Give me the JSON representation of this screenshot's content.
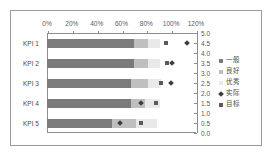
{
  "chart_data": {
    "type": "bar",
    "title": "",
    "xlabel": "",
    "ylabel": "",
    "categories": [
      "KPI 1",
      "KPI 2",
      "KPI 3",
      "KPI 4",
      "KPI 5"
    ],
    "x_tick_labels": [
      "0%",
      "20%",
      "40%",
      "60%",
      "80%",
      "100%",
      "120%"
    ],
    "x_tick_values": [
      0,
      20,
      40,
      60,
      80,
      100,
      120
    ],
    "xlim": [
      0,
      120
    ],
    "y2_tick_labels": [
      "0.0",
      "0.5",
      "1.0",
      "1.5",
      "2.0",
      "2.5",
      "3.0",
      "3.5",
      "4.0",
      "4.5",
      "5.0"
    ],
    "y2_tick_values": [
      0.0,
      0.5,
      1.0,
      1.5,
      2.0,
      2.5,
      3.0,
      3.5,
      4.0,
      4.5,
      5.0
    ],
    "y2lim": [
      0,
      5
    ],
    "grid": false,
    "legend_position": "right",
    "series": [
      {
        "name": "一般",
        "role": "range-band",
        "color": "#7b7b7b",
        "values": [
          70,
          70,
          68,
          68,
          52
        ]
      },
      {
        "name": "良好",
        "role": "range-band",
        "color": "#bfbfbf",
        "values": [
          11,
          11,
          13,
          11,
          20
        ]
      },
      {
        "name": "优秀",
        "role": "range-band",
        "color": "#e9e9e9",
        "values": [
          10,
          10,
          11,
          12,
          17
        ]
      },
      {
        "name": "实际",
        "role": "marker-diamond",
        "color": "#3d3d3d",
        "values": [
          113,
          101,
          100,
          76,
          59
        ]
      },
      {
        "name": "目标",
        "role": "marker-square",
        "color": "#5a5a5a",
        "values": [
          96,
          97,
          92,
          88,
          76
        ]
      }
    ]
  },
  "legend": {
    "entries": [
      {
        "label": "一般",
        "color": "#7b7b7b",
        "shape": "square"
      },
      {
        "label": "良好",
        "color": "#bfbfbf",
        "shape": "square"
      },
      {
        "label": "优秀",
        "color": "#e9e9e9",
        "shape": "square"
      },
      {
        "label": "实际",
        "color": "#3d3d3d",
        "shape": "diamond"
      },
      {
        "label": "目标",
        "color": "#5a5a5a",
        "shape": "square"
      }
    ]
  }
}
